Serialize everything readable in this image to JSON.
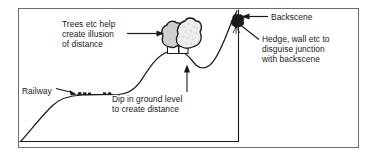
{
  "diagram": {
    "type": "line-diagram",
    "background_color": "#ffffff",
    "ink_color": "#1a1a1a",
    "frame": {
      "outer_border_color": "#6b6b6b",
      "inner_baseline_color": "#1a1a1a"
    },
    "labels": {
      "trees": "Trees etc help\ncreate illusion\nof distance",
      "railway": "Railway",
      "dip": "Dip in ground level\nto create distance",
      "backscene": "Backscene",
      "hedge": "Hedge, wall etc to\ndisguise junction\nwith backscene"
    },
    "features": {
      "tree_fill_left": "#d0d0d0",
      "tree_fill_right": "#e6e6e6",
      "hedge_fill": "#1a1a1a",
      "track_color": "#1a1a1a"
    }
  }
}
